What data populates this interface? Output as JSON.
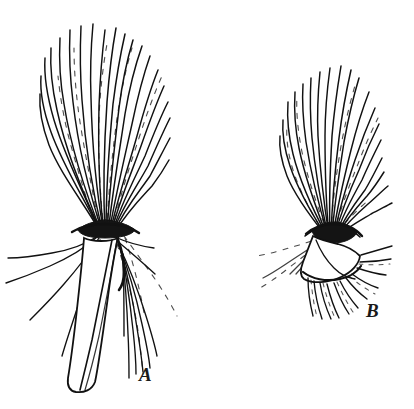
{
  "figure": {
    "kind": "botanical-line-illustration",
    "background_color": "#ffffff",
    "ink_color": "#111111",
    "width": 414,
    "height": 409,
    "panels": [
      {
        "id": "A",
        "label": "A",
        "label_x": 139,
        "label_y": 365,
        "description": "elongate achene with long tapering beak and dense erect pappus bristles",
        "pappus_apex_y": 22,
        "pappus_base_y": 232,
        "body_top_y": 236,
        "body_tip_y": 392,
        "center_x": 104,
        "bristle_count": 34,
        "body_color": "#ffffff",
        "knot_color": "#141414"
      },
      {
        "id": "B",
        "label": "B",
        "label_x": 366,
        "label_y": 301,
        "description": "compact foreshortened achene with rounded pappus tuft, viewed obliquely",
        "pappus_apex_y": 55,
        "pappus_base_y": 235,
        "body_top_y": 232,
        "body_tip_y": 280,
        "center_x": 330,
        "bristle_count": 28,
        "body_color": "#ffffff",
        "knot_color": "#141414"
      }
    ]
  }
}
